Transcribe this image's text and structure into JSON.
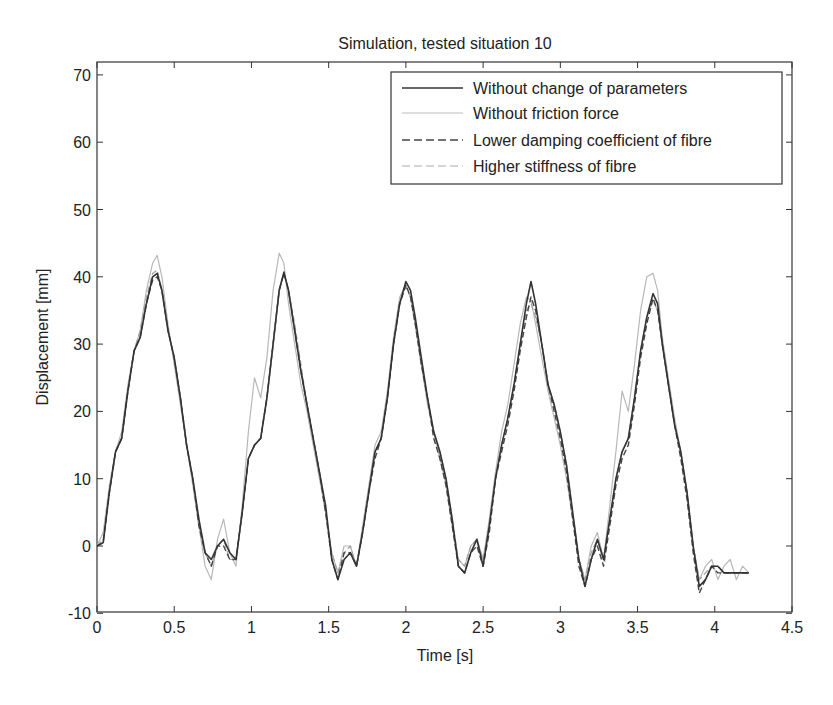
{
  "chart_data": {
    "type": "line",
    "title": "Simulation, tested situation 10",
    "xlabel": "Time [s]",
    "ylabel": "Displacement [mm]",
    "xlim": [
      0,
      4.5
    ],
    "ylim": [
      -10,
      72
    ],
    "xticks": [
      0,
      0.5,
      1,
      1.5,
      2,
      2.5,
      3,
      3.5,
      4,
      4.5
    ],
    "xtick_labels": [
      "0",
      "0.5",
      "1",
      "1.5",
      "2",
      "2.5",
      "3",
      "3.5",
      "4",
      "4.5"
    ],
    "yticks": [
      -10,
      0,
      10,
      20,
      30,
      40,
      50,
      60,
      70
    ],
    "ytick_labels": [
      "-10",
      "0",
      "10",
      "20",
      "30",
      "40",
      "50",
      "60",
      "70"
    ],
    "grid": false,
    "legend_position": "upper right",
    "series": [
      {
        "name": "Without change of parameters",
        "style": "solid",
        "color": "#333333",
        "width": 1.6,
        "x": [
          0,
          0.04,
          0.08,
          0.12,
          0.16,
          0.2,
          0.24,
          0.28,
          0.32,
          0.36,
          0.39,
          0.42,
          0.46,
          0.5,
          0.54,
          0.58,
          0.62,
          0.66,
          0.7,
          0.74,
          0.78,
          0.82,
          0.86,
          0.9,
          0.94,
          0.98,
          1.02,
          1.06,
          1.1,
          1.14,
          1.18,
          1.21,
          1.24,
          1.28,
          1.32,
          1.36,
          1.4,
          1.44,
          1.48,
          1.52,
          1.56,
          1.6,
          1.64,
          1.68,
          1.72,
          1.76,
          1.8,
          1.84,
          1.88,
          1.92,
          1.96,
          2.0,
          2.03,
          2.06,
          2.1,
          2.14,
          2.18,
          2.22,
          2.26,
          2.3,
          2.34,
          2.38,
          2.42,
          2.46,
          2.5,
          2.54,
          2.58,
          2.62,
          2.66,
          2.7,
          2.74,
          2.78,
          2.81,
          2.84,
          2.88,
          2.92,
          2.96,
          3.0,
          3.04,
          3.08,
          3.12,
          3.16,
          3.2,
          3.24,
          3.28,
          3.32,
          3.36,
          3.4,
          3.44,
          3.48,
          3.52,
          3.56,
          3.6,
          3.63,
          3.66,
          3.7,
          3.74,
          3.78,
          3.82,
          3.86,
          3.9,
          3.94,
          3.98,
          4.02,
          4.06,
          4.1,
          4.14,
          4.18,
          4.22
        ],
        "y": [
          0,
          0.5,
          8,
          14,
          16,
          23,
          29,
          31,
          36,
          40,
          40.5,
          38,
          32,
          28,
          22,
          15,
          10,
          4,
          -1,
          -2,
          0,
          1,
          -1,
          -2,
          5,
          13,
          15,
          16,
          22,
          30,
          38,
          40.7,
          38,
          32,
          26,
          21,
          16,
          11,
          6,
          -2,
          -5,
          -2,
          -1,
          -3,
          2,
          8,
          14,
          16,
          22,
          30,
          36,
          39.3,
          38,
          34,
          28,
          22,
          17,
          14,
          10,
          4,
          -3,
          -4,
          -1,
          1,
          -3,
          3,
          10,
          15,
          19,
          24,
          30,
          36,
          39.3,
          36,
          30,
          24,
          21,
          17,
          12,
          5,
          -2,
          -6,
          -2,
          1,
          -2,
          4,
          10,
          14,
          16,
          22,
          29,
          34,
          37.5,
          36,
          30,
          24,
          18,
          14,
          8,
          0,
          -6,
          -5,
          -3,
          -3,
          -4,
          -4,
          -4,
          -4,
          -4
        ]
      },
      {
        "name": "Without friction force",
        "style": "solid",
        "color": "#b8b8b8",
        "width": 1.2,
        "x": [
          0,
          0.04,
          0.08,
          0.12,
          0.16,
          0.2,
          0.24,
          0.28,
          0.32,
          0.36,
          0.39,
          0.42,
          0.46,
          0.5,
          0.54,
          0.58,
          0.62,
          0.66,
          0.7,
          0.74,
          0.78,
          0.82,
          0.86,
          0.9,
          0.94,
          0.98,
          1.02,
          1.06,
          1.1,
          1.14,
          1.18,
          1.21,
          1.24,
          1.28,
          1.32,
          1.36,
          1.4,
          1.44,
          1.48,
          1.52,
          1.56,
          1.6,
          1.64,
          1.68,
          1.72,
          1.76,
          1.8,
          1.84,
          1.88,
          1.92,
          1.96,
          2.0,
          2.03,
          2.06,
          2.1,
          2.14,
          2.18,
          2.22,
          2.26,
          2.3,
          2.34,
          2.38,
          2.42,
          2.46,
          2.5,
          2.54,
          2.58,
          2.62,
          2.66,
          2.7,
          2.74,
          2.78,
          2.81,
          2.84,
          2.88,
          2.92,
          2.96,
          3.0,
          3.04,
          3.08,
          3.12,
          3.16,
          3.2,
          3.24,
          3.28,
          3.32,
          3.36,
          3.4,
          3.44,
          3.48,
          3.52,
          3.56,
          3.6,
          3.63,
          3.66,
          3.7,
          3.74,
          3.78,
          3.82,
          3.86,
          3.9,
          3.94,
          3.98,
          4.02,
          4.06,
          4.1,
          4.14,
          4.18,
          4.22
        ],
        "y": [
          0,
          2,
          9,
          14,
          17,
          24,
          29,
          32,
          38,
          42,
          43.2,
          40,
          33,
          27,
          21,
          15,
          9,
          3,
          -3,
          -5,
          1,
          4,
          -1,
          -3,
          6,
          17,
          25,
          22,
          28,
          38,
          43.5,
          42,
          36,
          30,
          24,
          20,
          15,
          10,
          5,
          -1,
          -4,
          0,
          0,
          -3,
          3,
          9,
          15,
          17,
          23,
          31,
          37,
          38.8,
          37,
          33,
          27,
          21,
          17,
          13,
          9,
          3,
          -2,
          -3,
          0,
          1,
          -2,
          4,
          11,
          17,
          21,
          27,
          33,
          37,
          36.5,
          33,
          28,
          23,
          19,
          15,
          10,
          4,
          -2,
          -5,
          0,
          2,
          -2,
          6,
          14,
          23,
          20,
          27,
          35,
          40,
          40.5,
          38,
          31,
          25,
          19,
          14,
          8,
          0,
          -5,
          -3,
          -2,
          -5,
          -3,
          -2,
          -5,
          -3,
          -4
        ]
      },
      {
        "name": "Lower damping coefficient of fibre",
        "style": "dashed",
        "color": "#444444",
        "width": 1.4,
        "x": [
          0,
          0.04,
          0.08,
          0.12,
          0.16,
          0.2,
          0.24,
          0.28,
          0.32,
          0.36,
          0.39,
          0.42,
          0.46,
          0.5,
          0.54,
          0.58,
          0.62,
          0.66,
          0.7,
          0.74,
          0.78,
          0.82,
          0.86,
          0.9,
          0.94,
          0.98,
          1.02,
          1.06,
          1.1,
          1.14,
          1.18,
          1.21,
          1.24,
          1.28,
          1.32,
          1.36,
          1.4,
          1.44,
          1.48,
          1.52,
          1.56,
          1.6,
          1.64,
          1.68,
          1.72,
          1.76,
          1.8,
          1.84,
          1.88,
          1.92,
          1.96,
          2.0,
          2.03,
          2.06,
          2.1,
          2.14,
          2.18,
          2.22,
          2.26,
          2.3,
          2.34,
          2.38,
          2.42,
          2.46,
          2.5,
          2.54,
          2.58,
          2.62,
          2.66,
          2.7,
          2.74,
          2.78,
          2.81,
          2.84,
          2.88,
          2.92,
          2.96,
          3.0,
          3.04,
          3.08,
          3.12,
          3.16,
          3.2,
          3.24,
          3.28,
          3.32,
          3.36,
          3.4,
          3.44,
          3.48,
          3.52,
          3.56,
          3.6,
          3.63,
          3.66,
          3.7,
          3.74,
          3.78,
          3.82,
          3.86,
          3.9,
          3.94,
          3.98,
          4.02,
          4.06,
          4.1,
          4.14,
          4.18,
          4.22
        ],
        "y": [
          0,
          0.5,
          8,
          14,
          16,
          23,
          29,
          31,
          36,
          39.5,
          40,
          38,
          32,
          28,
          22,
          15,
          10,
          3,
          -1,
          -3,
          0,
          0,
          -2,
          -2,
          5,
          13,
          15,
          16,
          22,
          30,
          38,
          40.5,
          38,
          32,
          26,
          21,
          16,
          11,
          5,
          -2,
          -5,
          -1,
          -1,
          -3,
          2,
          8,
          13,
          16,
          22,
          30,
          36,
          38.8,
          37,
          33,
          27,
          22,
          16,
          13,
          9,
          3,
          -3,
          -4,
          -1,
          0,
          -3,
          2,
          10,
          14,
          18,
          23,
          29,
          34,
          37,
          35,
          30,
          24,
          20,
          16,
          11,
          4,
          -3,
          -6,
          -2,
          0,
          -3,
          3,
          9,
          13,
          15,
          21,
          28,
          33,
          36.8,
          35,
          30,
          24,
          18,
          13,
          7,
          -1,
          -7,
          -5,
          -3,
          -4,
          -4,
          -4,
          -4,
          -4,
          -4
        ]
      },
      {
        "name": "Higher stiffness of fibre",
        "style": "dashed",
        "color": "#a0a0a0",
        "width": 1.2,
        "x": [
          0,
          0.04,
          0.08,
          0.12,
          0.16,
          0.2,
          0.24,
          0.28,
          0.32,
          0.36,
          0.39,
          0.42,
          0.46,
          0.5,
          0.54,
          0.58,
          0.62,
          0.66,
          0.7,
          0.74,
          0.78,
          0.82,
          0.86,
          0.9,
          0.94,
          0.98,
          1.02,
          1.06,
          1.1,
          1.14,
          1.18,
          1.21,
          1.24,
          1.28,
          1.32,
          1.36,
          1.4,
          1.44,
          1.48,
          1.52,
          1.56,
          1.6,
          1.64,
          1.68,
          1.72,
          1.76,
          1.8,
          1.84,
          1.88,
          1.92,
          1.96,
          2.0,
          2.03,
          2.06,
          2.1,
          2.14,
          2.18,
          2.22,
          2.26,
          2.3,
          2.34,
          2.38,
          2.42,
          2.46,
          2.5,
          2.54,
          2.58,
          2.62,
          2.66,
          2.7,
          2.74,
          2.78,
          2.81,
          2.84,
          2.88,
          2.92,
          2.96,
          3.0,
          3.04,
          3.08,
          3.12,
          3.16,
          3.2,
          3.24,
          3.28,
          3.32,
          3.36,
          3.4,
          3.44,
          3.48,
          3.52,
          3.56,
          3.6,
          3.63,
          3.66,
          3.7,
          3.74,
          3.78,
          3.82,
          3.86,
          3.9,
          3.94,
          3.98,
          4.02,
          4.06,
          4.1,
          4.14,
          4.18,
          4.22
        ],
        "y": [
          0,
          1,
          8,
          14,
          16,
          23,
          29,
          32,
          37,
          40.5,
          41,
          38,
          32,
          28,
          22,
          15,
          10,
          3,
          -1,
          -3,
          0,
          1,
          -2,
          -2,
          5,
          13,
          15,
          16,
          22,
          30,
          38,
          40.5,
          38,
          33,
          27,
          21,
          16,
          11,
          5,
          -1,
          -4,
          -1,
          0,
          -3,
          2,
          8,
          14,
          16,
          22,
          30,
          36,
          38.5,
          37,
          33,
          27,
          22,
          17,
          14,
          10,
          4,
          -2,
          -3,
          0,
          1,
          -2,
          3,
          10,
          15,
          19,
          24,
          30,
          35,
          36,
          34,
          30,
          24,
          21,
          17,
          12,
          5,
          -2,
          -5,
          -1,
          1,
          -2,
          4,
          10,
          14,
          16,
          22,
          29,
          34,
          36.5,
          35,
          30,
          24,
          18,
          14,
          8,
          0,
          -5,
          -4,
          -3,
          -3,
          -4,
          -4,
          -4,
          -4,
          -4
        ]
      }
    ]
  }
}
